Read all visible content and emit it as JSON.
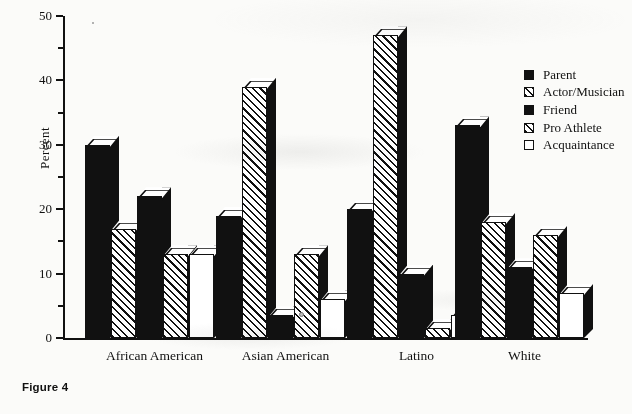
{
  "figure": {
    "caption": "Figure 4"
  },
  "chart_data": {
    "type": "bar",
    "title": "",
    "subtitle": "",
    "xlabel": "",
    "ylabel": "Percent",
    "ylim": [
      0,
      50
    ],
    "yticks": [
      0,
      10,
      20,
      30,
      40,
      50
    ],
    "ytick_labels": [
      "0",
      "10",
      "20",
      "30",
      "40",
      "50"
    ],
    "yminor_ticks": [
      5,
      15,
      25,
      35,
      45
    ],
    "grid": false,
    "legend_position": "right",
    "style": "3d-bars-black-and-white",
    "categories": [
      "African American",
      "Asian American",
      "Latino",
      "White"
    ],
    "series": [
      {
        "name": "Parent",
        "fill": "solid",
        "values": [
          30,
          19,
          20,
          33
        ]
      },
      {
        "name": "Actor/Musician",
        "fill": "hatch",
        "values": [
          17,
          39,
          47,
          18
        ]
      },
      {
        "name": "Friend",
        "fill": "solid",
        "values": [
          22,
          3.5,
          10,
          11
        ]
      },
      {
        "name": "Pro Athlete",
        "fill": "hatch",
        "values": [
          13,
          13,
          1.5,
          16
        ]
      },
      {
        "name": "Acquaintance",
        "fill": "white",
        "values": [
          13,
          6,
          3.5,
          7
        ]
      }
    ]
  },
  "legend": {
    "items": [
      {
        "label": "Parent",
        "fill": "solid"
      },
      {
        "label": "Actor/Musician",
        "fill": "hatch"
      },
      {
        "label": "Friend",
        "fill": "solid"
      },
      {
        "label": "Pro Athlete",
        "fill": "hatch"
      },
      {
        "label": "Acquaintance",
        "fill": "white"
      }
    ]
  },
  "colors": {
    "ink": "#111111",
    "paper": "#fbfbf9",
    "bar_fill_white": "#ffffff"
  }
}
